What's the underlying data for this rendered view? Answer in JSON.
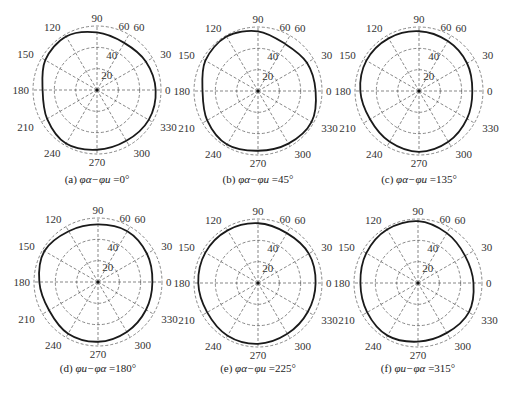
{
  "figure": {
    "panel_layout": {
      "cols": 3,
      "rows": 2
    },
    "ring_labels": [
      "20",
      "40",
      "60"
    ],
    "angle_labels": [
      "0",
      "30",
      "60",
      "90",
      "120",
      "150",
      "180",
      "210",
      "240",
      "270",
      "300",
      "330"
    ]
  },
  "chart_data": [
    {
      "type": "polar-line",
      "id": "a",
      "title": "(a) φα−φu=0°",
      "caption_prefix": "(a)",
      "caption_phase": "φα−φu",
      "caption_value": "=0°",
      "rmax": 60,
      "rticks": [
        20,
        40,
        60
      ],
      "theta_ticks": [
        0,
        30,
        60,
        90,
        120,
        150,
        180,
        210,
        240,
        270,
        300,
        330
      ],
      "theta": [
        0,
        30,
        60,
        90,
        120,
        150,
        180,
        210,
        240,
        270,
        300,
        330
      ],
      "r": [
        55,
        53,
        51,
        54,
        58,
        56,
        51,
        54,
        58,
        56,
        55,
        56
      ]
    },
    {
      "type": "polar-line",
      "id": "b",
      "title": "(b) φα−φu=45°",
      "caption_prefix": "(b)",
      "caption_phase": "φα−φu",
      "caption_value": "=45°",
      "rmax": 60,
      "rticks": [
        20,
        40,
        60
      ],
      "theta_ticks": [
        0,
        30,
        60,
        90,
        120,
        150,
        180,
        210,
        240,
        270,
        300,
        330
      ],
      "theta": [
        0,
        30,
        60,
        90,
        120,
        150,
        180,
        210,
        240,
        270,
        300,
        330
      ],
      "r": [
        54,
        53,
        51,
        56,
        59,
        57,
        52,
        55,
        58,
        56,
        57,
        58
      ]
    },
    {
      "type": "polar-line",
      "id": "c",
      "title": "(c) φα−φu=135°",
      "caption_prefix": "(c)",
      "caption_phase": "φα−φu",
      "caption_value": "=135°",
      "rmax": 60,
      "rticks": [
        20,
        40,
        60
      ],
      "theta_ticks": [
        0,
        30,
        60,
        90,
        120,
        150,
        180,
        210,
        240,
        270,
        300,
        330
      ],
      "theta": [
        0,
        30,
        60,
        90,
        120,
        150,
        180,
        210,
        240,
        270,
        300,
        330
      ],
      "r": [
        50,
        52,
        54,
        56,
        57,
        57,
        55,
        53,
        55,
        57,
        55,
        52
      ]
    },
    {
      "type": "polar-line",
      "id": "d",
      "title": "(d) φu−φα=180°",
      "caption_prefix": "(d)",
      "caption_phase": "φu−φα",
      "caption_value": "=180°",
      "rmax": 60,
      "rticks": [
        20,
        40,
        60
      ],
      "theta_ticks": [
        0,
        30,
        60,
        90,
        120,
        150,
        180,
        210,
        240,
        270,
        300,
        330
      ],
      "theta": [
        0,
        30,
        60,
        90,
        120,
        150,
        180,
        210,
        240,
        270,
        300,
        330
      ],
      "r": [
        51,
        53,
        55,
        54,
        55,
        58,
        55,
        53,
        56,
        56,
        54,
        52
      ]
    },
    {
      "type": "polar-line",
      "id": "e",
      "title": "(e) φα−φu=225°",
      "caption_prefix": "(e)",
      "caption_phase": "φα−φu",
      "caption_value": "=225°",
      "rmax": 60,
      "rticks": [
        20,
        40,
        60
      ],
      "theta_ticks": [
        0,
        30,
        60,
        90,
        120,
        150,
        180,
        210,
        240,
        270,
        300,
        330
      ],
      "theta": [
        0,
        30,
        60,
        90,
        120,
        150,
        180,
        210,
        240,
        270,
        300,
        330
      ],
      "r": [
        54,
        55,
        54,
        56,
        57,
        57,
        56,
        55,
        57,
        57,
        55,
        54
      ]
    },
    {
      "type": "polar-line",
      "id": "f",
      "title": "(f) φu−φα=315°",
      "caption_prefix": "(f)",
      "caption_phase": "φu−φα",
      "caption_value": "=315°",
      "rmax": 60,
      "rticks": [
        20,
        40,
        60
      ],
      "theta_ticks": [
        0,
        30,
        60,
        90,
        120,
        150,
        180,
        210,
        240,
        270,
        300,
        330
      ],
      "theta": [
        0,
        30,
        60,
        90,
        120,
        150,
        180,
        210,
        240,
        270,
        300,
        330
      ],
      "r": [
        52,
        51,
        54,
        58,
        58,
        56,
        54,
        55,
        57,
        55,
        54,
        55
      ]
    }
  ],
  "panels_geometry": [
    {
      "cx": 97,
      "cy": 90,
      "R": 64,
      "caption_x": 97,
      "caption_y": 183
    },
    {
      "cx": 258,
      "cy": 91,
      "R": 64,
      "caption_x": 258,
      "caption_y": 183
    },
    {
      "cx": 419,
      "cy": 91,
      "R": 64,
      "caption_x": 419,
      "caption_y": 183
    },
    {
      "cx": 98,
      "cy": 282,
      "R": 64,
      "caption_x": 98,
      "caption_y": 372
    },
    {
      "cx": 258,
      "cy": 283,
      "R": 64,
      "caption_x": 258,
      "caption_y": 372
    },
    {
      "cx": 418,
      "cy": 283,
      "R": 64,
      "caption_x": 418,
      "caption_y": 372
    }
  ]
}
